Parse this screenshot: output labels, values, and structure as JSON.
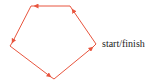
{
  "diagram": {
    "type": "closed-path-pentagon",
    "stroke_color": "#e8553e",
    "direction": "counter-clockwise",
    "vertices": [
      {
        "id": "start",
        "x": 96,
        "y": 44
      },
      {
        "id": "top-right",
        "x": 70,
        "y": 6
      },
      {
        "id": "top-left",
        "x": 31,
        "y": 6
      },
      {
        "id": "left",
        "x": 10,
        "y": 46
      },
      {
        "id": "bottom",
        "x": 54,
        "y": 79
      }
    ],
    "label": "start/finish"
  }
}
